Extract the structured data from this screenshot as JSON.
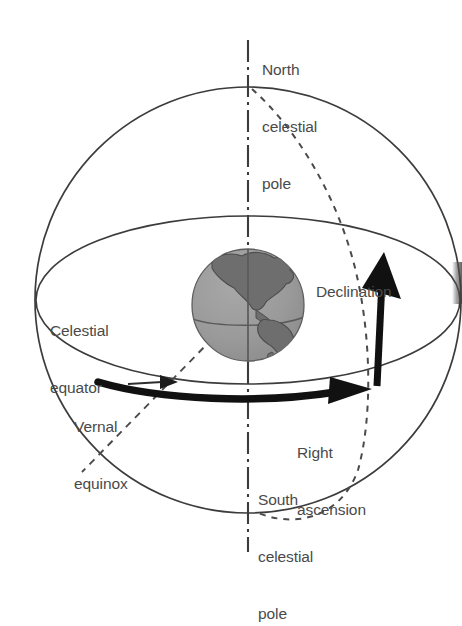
{
  "labels": {
    "north_celestial_pole": {
      "lines": [
        "North",
        "celestial",
        "pole"
      ],
      "x": 262,
      "y": 22
    },
    "declination": {
      "text": "Declination",
      "x": 316,
      "y": 244
    },
    "celestial_equator": {
      "lines": [
        "Celestial",
        "equator"
      ],
      "x": 50,
      "y": 283
    },
    "vernal_equinox": {
      "lines": [
        "Vernal",
        "equinox"
      ],
      "x": 74,
      "y": 379
    },
    "right_ascension": {
      "lines": [
        "Right",
        "ascension"
      ],
      "x": 297,
      "y": 405
    },
    "south_celestial_pole": {
      "lines": [
        "South",
        "celestial",
        "pole"
      ],
      "x": 258,
      "y": 452
    }
  },
  "geometry": {
    "sphere": {
      "cx": 248,
      "cy": 300,
      "r": 213
    },
    "celestial_equator_ellipse": {
      "cx": 248,
      "cy": 300,
      "rx": 212,
      "ry": 84
    },
    "earth": {
      "cx": 248,
      "cy": 305,
      "r": 56
    },
    "polar_axis": {
      "x": 248,
      "y_top": 40,
      "y_bottom": 552
    }
  },
  "colors": {
    "line": "#3c3c3c",
    "text": "#4a4a4a",
    "earth_ocean": "#9a9a9a",
    "earth_land": "#6e6e6e",
    "arrow": "#111111",
    "background": "#ffffff"
  },
  "icons": {
    "declination_arrow": "up-arrow-icon",
    "right_ascension_arrow": "right-arrow-icon",
    "vernal_equinox_pointer": "pointer-arrow-icon"
  }
}
